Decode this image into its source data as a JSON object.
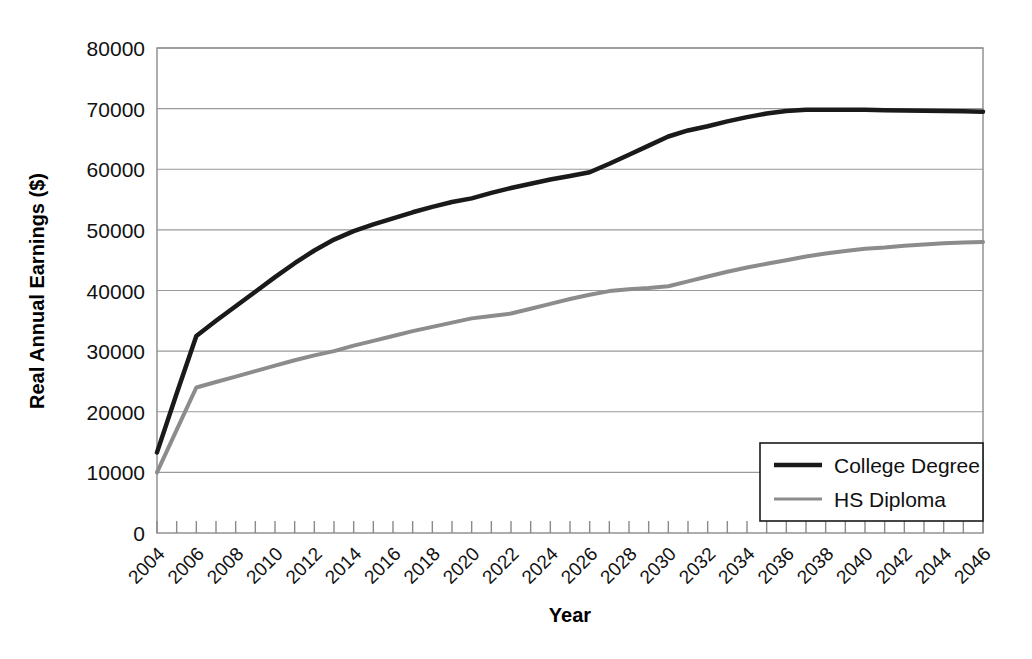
{
  "chart_data": {
    "type": "line",
    "title": "",
    "xlabel": "Year",
    "ylabel": "Real Annual Earnings ($)",
    "xlim": [
      2004,
      2046
    ],
    "ylim": [
      0,
      80000
    ],
    "grid": true,
    "legend_position": "lower-right",
    "y_ticks": [
      0,
      10000,
      20000,
      30000,
      40000,
      50000,
      60000,
      70000,
      80000
    ],
    "y_tick_labels": [
      "0",
      "10000",
      "20000",
      "30000",
      "40000",
      "50000",
      "60000",
      "70000",
      "80000"
    ],
    "x_ticks": [
      2004,
      2005,
      2006,
      2007,
      2008,
      2009,
      2010,
      2011,
      2012,
      2013,
      2014,
      2015,
      2016,
      2017,
      2018,
      2019,
      2020,
      2021,
      2022,
      2023,
      2024,
      2025,
      2026,
      2027,
      2028,
      2029,
      2030,
      2031,
      2032,
      2033,
      2034,
      2035,
      2036,
      2037,
      2038,
      2039,
      2040,
      2041,
      2042,
      2043,
      2044,
      2045,
      2046
    ],
    "x_tick_labels": [
      "2004",
      "2006",
      "2008",
      "2010",
      "2012",
      "2014",
      "2016",
      "2018",
      "2020",
      "2022",
      "2024",
      "2026",
      "2028",
      "2030",
      "2032",
      "2034",
      "2036",
      "2038",
      "2040",
      "2042",
      "2044",
      "2046"
    ],
    "x_tick_label_years": [
      2004,
      2006,
      2008,
      2010,
      2012,
      2014,
      2016,
      2018,
      2020,
      2022,
      2024,
      2026,
      2028,
      2030,
      2032,
      2034,
      2036,
      2038,
      2040,
      2042,
      2044,
      2046
    ],
    "x_tick_label_rotation": -45,
    "series": [
      {
        "name": "College Degree",
        "color": "#1a1a1a",
        "width": 4.5,
        "x": [
          2004,
          2005,
          2006,
          2007,
          2008,
          2009,
          2010,
          2011,
          2012,
          2013,
          2014,
          2015,
          2016,
          2017,
          2018,
          2019,
          2020,
          2021,
          2022,
          2023,
          2024,
          2025,
          2026,
          2027,
          2028,
          2029,
          2030,
          2031,
          2032,
          2033,
          2034,
          2035,
          2036,
          2037,
          2038,
          2039,
          2040,
          2041,
          2042,
          2043,
          2044,
          2045,
          2046
        ],
        "values": [
          13300,
          23000,
          32500,
          35000,
          37400,
          39800,
          42200,
          44500,
          46600,
          48400,
          49800,
          50900,
          51900,
          52900,
          53800,
          54600,
          55200,
          56100,
          56900,
          57600,
          58300,
          58900,
          59500,
          60900,
          62400,
          63900,
          65400,
          66400,
          67100,
          67900,
          68600,
          69200,
          69600,
          69800,
          69800,
          69800,
          69800,
          69750,
          69700,
          69650,
          69600,
          69550,
          69500
        ]
      },
      {
        "name": "HS Diploma",
        "color": "#8c8c8c",
        "width": 4.0,
        "x": [
          2004,
          2005,
          2006,
          2007,
          2008,
          2009,
          2010,
          2011,
          2012,
          2013,
          2014,
          2015,
          2016,
          2017,
          2018,
          2019,
          2020,
          2021,
          2022,
          2023,
          2024,
          2025,
          2026,
          2027,
          2028,
          2029,
          2030,
          2031,
          2032,
          2033,
          2034,
          2035,
          2036,
          2037,
          2038,
          2039,
          2040,
          2041,
          2042,
          2043,
          2044,
          2045,
          2046
        ],
        "values": [
          10000,
          17000,
          24000,
          24900,
          25800,
          26700,
          27600,
          28500,
          29300,
          30000,
          30900,
          31700,
          32500,
          33300,
          34000,
          34700,
          35400,
          35800,
          36200,
          37000,
          37800,
          38600,
          39300,
          39900,
          40200,
          40400,
          40700,
          41500,
          42300,
          43100,
          43800,
          44400,
          45000,
          45600,
          46100,
          46500,
          46900,
          47100,
          47400,
          47600,
          47800,
          47900,
          48000
        ]
      }
    ]
  },
  "legend": {
    "entries": [
      {
        "label": "College Degree",
        "color": "#1a1a1a",
        "style": "solid"
      },
      {
        "label": "HS Diploma",
        "color": "#8c8c8c",
        "style": "solid-thin"
      }
    ]
  }
}
